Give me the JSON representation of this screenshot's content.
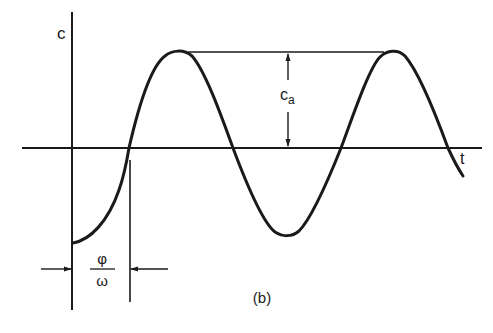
{
  "figure": {
    "caption": "(b)",
    "y_axis_label": "c",
    "x_axis_label": "t",
    "amplitude_label": {
      "main": "c",
      "subscript": "a"
    },
    "phase_label": {
      "numerator": "φ",
      "denominator": "ω"
    },
    "colors": {
      "ink": "#1a1a1a",
      "background": "#ffffff"
    }
  },
  "geometry": {
    "origin": [
      72,
      148
    ],
    "x_axis": {
      "x1": 22,
      "x2": 482,
      "y": 148
    },
    "y_axis": {
      "x": 72,
      "y1": 12,
      "y2": 310
    },
    "peaks": [
      [
        178,
        52
      ],
      [
        393,
        52
      ]
    ],
    "trough": [
      287,
      234
    ],
    "zero_crossings": [
      129,
      233,
      341,
      448
    ],
    "curve_start": [
      73,
      243
    ],
    "curve_end": [
      463,
      176
    ]
  }
}
